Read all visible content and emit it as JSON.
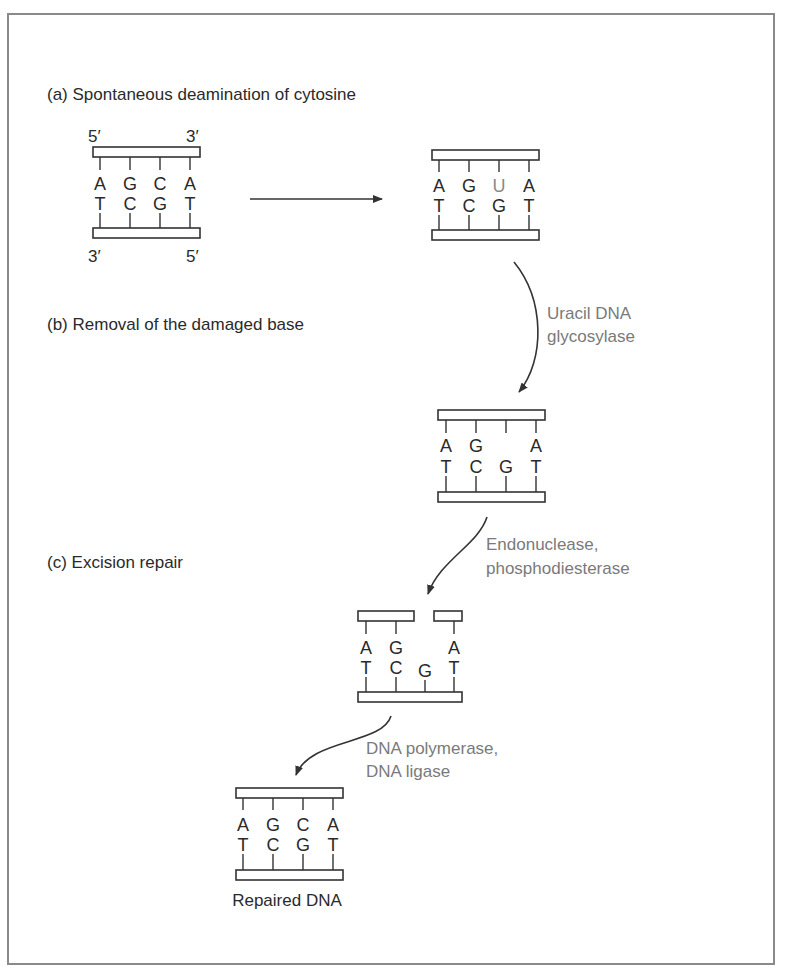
{
  "sections": {
    "a": "(a) Spontaneous deamination of cytosine",
    "b": "(b) Removal of the damaged base",
    "c": "(c) Excision repair"
  },
  "strand_ends": {
    "top_left": "5′",
    "top_right": "3′",
    "bottom_left": "3′",
    "bottom_right": "5′"
  },
  "enzymes": {
    "step1_line1": "Uracil DNA",
    "step1_line2": "glycosylase",
    "step2_line1": "Endonuclease,",
    "step2_line2": "phosphodiesterase",
    "step3_line1": "DNA polymerase,",
    "step3_line2": "DNA ligase"
  },
  "duplexes": [
    {
      "id": "original",
      "top": [
        "A",
        "G",
        "C",
        "A"
      ],
      "bottom": [
        "T",
        "C",
        "G",
        "T"
      ]
    },
    {
      "id": "deaminated",
      "top": [
        "A",
        "G",
        "U",
        "A"
      ],
      "bottom": [
        "T",
        "C",
        "G",
        "T"
      ],
      "damaged_index": 2
    },
    {
      "id": "base-removed",
      "top": [
        "A",
        "G",
        "",
        "A"
      ],
      "bottom": [
        "T",
        "C",
        "G",
        "T"
      ]
    },
    {
      "id": "excised",
      "top": [
        "A",
        "G",
        "",
        "A"
      ],
      "bottom": [
        "T",
        "C",
        "G",
        "T"
      ]
    },
    {
      "id": "repaired",
      "top": [
        "A",
        "G",
        "C",
        "A"
      ],
      "bottom": [
        "T",
        "C",
        "G",
        "T"
      ]
    }
  ],
  "caption": "Repaired DNA",
  "colors": {
    "ink": "#2a2a2a",
    "enzyme_text": "#7a7a7a",
    "damaged_base": "#8a8a8a",
    "frame": "#8a8a8a"
  }
}
